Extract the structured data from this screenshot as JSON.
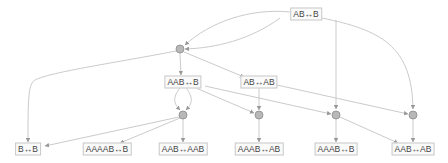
{
  "diagram": {
    "type": "directed-graph",
    "state_nodes": [
      {
        "id": "n0",
        "label": "AB↔B",
        "x": 306,
        "y": 14
      },
      {
        "id": "n1",
        "label": "AAB↔B",
        "x": 183,
        "y": 82
      },
      {
        "id": "n2",
        "label": "AB↔AB",
        "x": 259,
        "y": 82
      },
      {
        "id": "n3",
        "label": "B↔B",
        "x": 28,
        "y": 149
      },
      {
        "id": "n4",
        "label": "AAAAB↔B",
        "x": 107,
        "y": 149
      },
      {
        "id": "n5",
        "label": "AAB↔AAB",
        "x": 183,
        "y": 149
      },
      {
        "id": "n6",
        "label": "AAAB↔AB",
        "x": 259,
        "y": 149
      },
      {
        "id": "n7",
        "label": "AAAB↔B",
        "x": 336,
        "y": 149
      },
      {
        "id": "n8",
        "label": "AAB↔AB",
        "x": 413,
        "y": 149
      }
    ],
    "event_nodes": [
      {
        "id": "e0",
        "x": 180,
        "y": 49
      },
      {
        "id": "e1",
        "x": 183,
        "y": 115
      },
      {
        "id": "e2",
        "x": 259,
        "y": 115
      },
      {
        "id": "e3",
        "x": 336,
        "y": 115
      },
      {
        "id": "e4",
        "x": 413,
        "y": 115
      }
    ],
    "edges": [
      [
        "n0",
        "e0"
      ],
      [
        "n0",
        "e3"
      ],
      [
        "n0",
        "e4"
      ],
      [
        "e0",
        "n3"
      ],
      [
        "e0",
        "n1"
      ],
      [
        "e0",
        "n2"
      ],
      [
        "n1",
        "e1"
      ],
      [
        "n1",
        "e1"
      ],
      [
        "n1",
        "e2"
      ],
      [
        "n1",
        "e4"
      ],
      [
        "n2",
        "e2"
      ],
      [
        "n2",
        "e3"
      ],
      [
        "e1",
        "n3"
      ],
      [
        "e1",
        "n4"
      ],
      [
        "e1",
        "n5"
      ],
      [
        "e2",
        "n6"
      ],
      [
        "e3",
        "n7"
      ],
      [
        "e3",
        "n8"
      ],
      [
        "e4",
        "n8"
      ]
    ],
    "colors": {
      "edge": "#c4c4c4",
      "event_fill": "#b8b8b8",
      "event_stroke": "#8c8c8c",
      "label_border": "#c8c8c8"
    }
  }
}
